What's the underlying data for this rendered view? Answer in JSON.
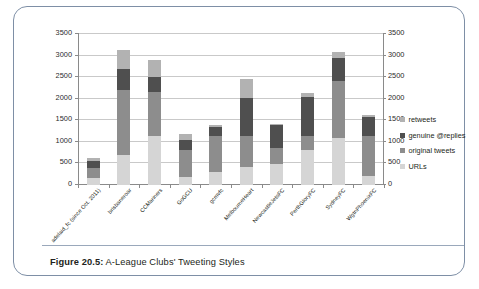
{
  "figure": {
    "caption_label": "Figure 20.5:",
    "caption_text": " A-League Clubs' Tweeting Styles"
  },
  "chart_data": {
    "type": "bar",
    "subtype": "stacked-vertical",
    "title": "",
    "xlabel": "",
    "ylabel": "",
    "ylim": [
      0,
      3500
    ],
    "yticks": [
      0,
      500,
      1000,
      1500,
      2000,
      2500,
      3000,
      3500
    ],
    "ytick_labels": [
      "0",
      "500",
      "1000",
      "1500",
      "2000",
      "2500",
      "3000",
      "3500"
    ],
    "dual_axis": true,
    "right_axis_same_as_left": true,
    "grid": true,
    "grid_axis": "y",
    "legend_position": "right",
    "categories": [
      "adelaid_fc (since Oct. 2011)",
      "brisbaneroar",
      "CCMariners",
      "GoGCU",
      "gcmvfc",
      "MelbourneHeart",
      "NewcastleJetsFC",
      "PerthGloryFC",
      "SydneyFC",
      "WgtnPhoenixFC"
    ],
    "series": [
      {
        "name": "URLs",
        "color": "#d5d5d5",
        "values": [
          160,
          700,
          1120,
          190,
          300,
          420,
          490,
          800,
          1080,
          215
        ]
      },
      {
        "name": "original tweets",
        "color": "#8d8d8d",
        "values": [
          225,
          1480,
          1020,
          610,
          840,
          715,
          370,
          320,
          1310,
          925
        ]
      },
      {
        "name": "genuine @replies",
        "color": "#4f4f4f",
        "values": [
          165,
          500,
          350,
          240,
          200,
          870,
          535,
          900,
          525,
          415
        ]
      },
      {
        "name": "retweets",
        "color": "#b2b2b2",
        "values": [
          80,
          440,
          390,
          140,
          50,
          440,
          15,
          95,
          155,
          50
        ]
      }
    ],
    "totals": [
      630,
      3120,
      2880,
      1180,
      1390,
      2445,
      1410,
      2115,
      3070,
      1605
    ],
    "legend_entries": [
      "retweets",
      "genuine @replies",
      "original tweets",
      "URLs"
    ]
  },
  "colors": {
    "frame": "#7e8fa6",
    "gridline": "#c9c9c9",
    "axis": "#8a8a8a",
    "text": "#231f20"
  }
}
